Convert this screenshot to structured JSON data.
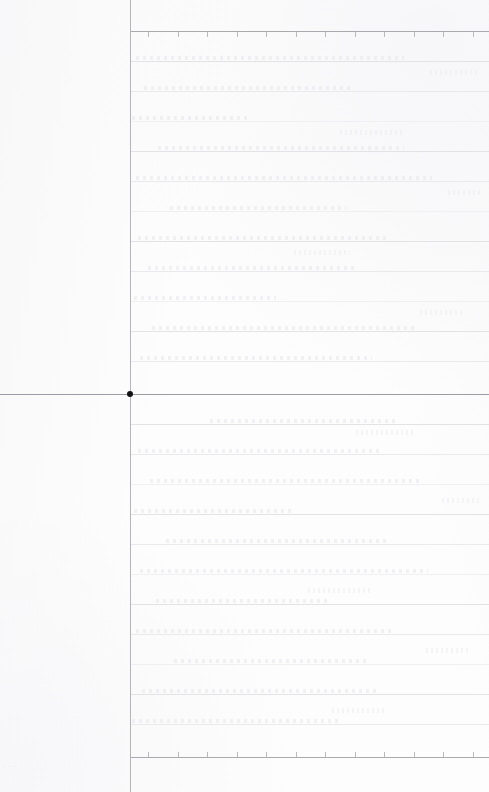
{
  "page": {
    "width": 489,
    "height": 792,
    "background_color": "#fdfdfd",
    "document_type": "scanned-ruled-sheet",
    "footer_mark_text": "· ·· ·"
  },
  "palette": {
    "background": "#fdfdfd",
    "rule_line": "#e3e3e6",
    "rule_line_faint": "#eaeaed",
    "axis_line": "#a9a9ae",
    "origin_line": "#9b9ba1",
    "margin_rule": "#b4b4b9",
    "origin_dot": "#111114",
    "tick": "#b9b9be",
    "ghost_text": "#e4e4e9"
  },
  "structure": {
    "margin_rule_x": 130,
    "origin_line_y": 394,
    "origin_dot": {
      "x": 130,
      "y": 394,
      "diameter": 6
    },
    "top_axis_y": 31,
    "bottom_axis_y": 757,
    "rule_spacing": 30,
    "body_left": 130,
    "body_right": 489
  },
  "top_ticks": {
    "start_x": 18,
    "spacing": 29.5,
    "count": 12,
    "direction": "down",
    "y": 32
  },
  "bottom_ticks": {
    "start_x": 18,
    "spacing": 29.5,
    "count": 12,
    "direction": "up",
    "y": 752
  },
  "rules_upper": [
    61,
    91,
    121,
    151,
    181,
    211,
    241,
    271,
    301,
    331,
    361
  ],
  "rules_lower": [
    424,
    454,
    484,
    514,
    544,
    574,
    604,
    634,
    664,
    694,
    724
  ],
  "ghost_rows_upper": [
    {
      "y": 56,
      "x": 6,
      "w": 268
    },
    {
      "y": 86,
      "x": 14,
      "w": 210
    },
    {
      "y": 116,
      "x": 2,
      "w": 118
    },
    {
      "y": 146,
      "x": 28,
      "w": 246
    },
    {
      "y": 176,
      "x": 6,
      "w": 296
    },
    {
      "y": 206,
      "x": 40,
      "w": 176
    },
    {
      "y": 236,
      "x": 8,
      "w": 252
    },
    {
      "y": 266,
      "x": 18,
      "w": 208
    },
    {
      "y": 296,
      "x": 4,
      "w": 142
    },
    {
      "y": 326,
      "x": 22,
      "w": 262
    },
    {
      "y": 356,
      "x": 10,
      "w": 232
    }
  ],
  "ghost_rows_lower": [
    {
      "y": 419,
      "x": 80,
      "w": 186
    },
    {
      "y": 449,
      "x": 8,
      "w": 244
    },
    {
      "y": 479,
      "x": 20,
      "w": 270
    },
    {
      "y": 509,
      "x": 4,
      "w": 158
    },
    {
      "y": 539,
      "x": 36,
      "w": 222
    },
    {
      "y": 569,
      "x": 10,
      "w": 288
    },
    {
      "y": 599,
      "x": 26,
      "w": 174
    },
    {
      "y": 629,
      "x": 6,
      "w": 256
    },
    {
      "y": 659,
      "x": 44,
      "w": 196
    },
    {
      "y": 689,
      "x": 12,
      "w": 238
    },
    {
      "y": 719,
      "x": 2,
      "w": 206
    }
  ],
  "ghost_blocks": [
    {
      "x": 300,
      "y": 70,
      "w": 48,
      "h": 5
    },
    {
      "x": 210,
      "y": 130,
      "w": 62,
      "h": 5
    },
    {
      "x": 318,
      "y": 190,
      "w": 34,
      "h": 5
    },
    {
      "x": 164,
      "y": 250,
      "w": 56,
      "h": 5
    },
    {
      "x": 290,
      "y": 310,
      "w": 44,
      "h": 5
    },
    {
      "x": 226,
      "y": 430,
      "w": 58,
      "h": 5
    },
    {
      "x": 312,
      "y": 498,
      "w": 38,
      "h": 5
    },
    {
      "x": 178,
      "y": 588,
      "w": 64,
      "h": 5
    },
    {
      "x": 296,
      "y": 648,
      "w": 42,
      "h": 5
    },
    {
      "x": 202,
      "y": 708,
      "w": 52,
      "h": 5
    }
  ]
}
